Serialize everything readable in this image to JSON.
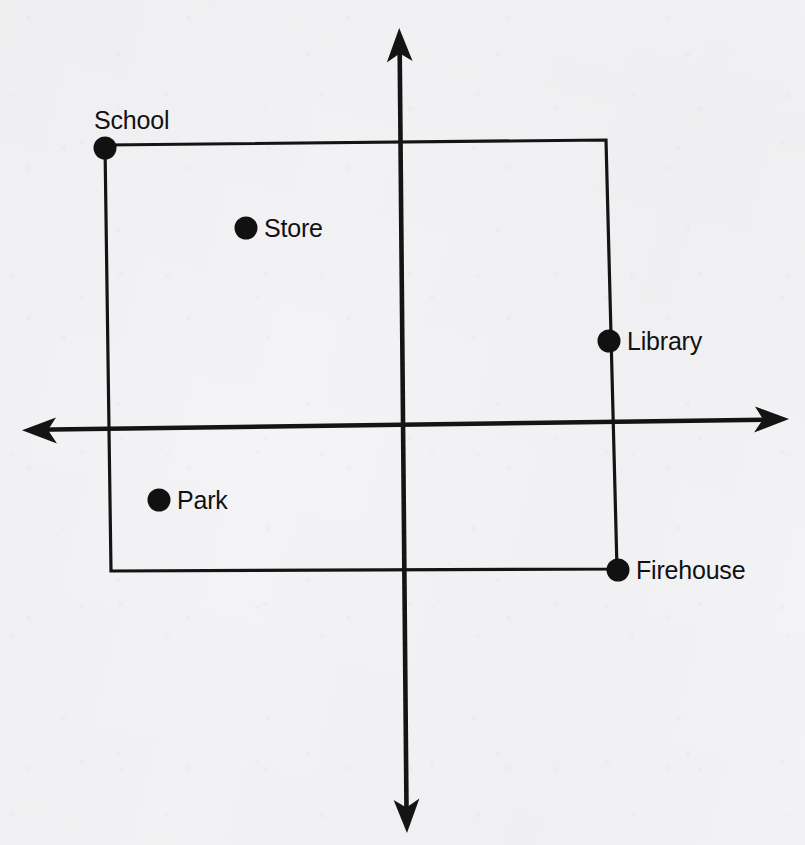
{
  "figure": {
    "background_color": "#f4f4f6",
    "ink_color": "#141414",
    "width": 805,
    "height": 845
  },
  "axes": {
    "origin": {
      "x": 401,
      "y": 427
    },
    "x_axis": {
      "name": "horizontal-axis",
      "left_tip": {
        "x": 22,
        "y": 430
      },
      "right_tip": {
        "x": 789,
        "y": 419
      },
      "arrow_left": true,
      "arrow_right": true
    },
    "y_axis": {
      "name": "vertical-axis",
      "top_tip": {
        "x": 399,
        "y": 28
      },
      "bottom_tip": {
        "x": 407,
        "y": 833
      },
      "arrow_top": true,
      "arrow_bottom": true
    }
  },
  "rectangle": {
    "name": "neighborhood-boundary-rectangle",
    "corners": {
      "top_left": {
        "x": 105,
        "y": 145
      },
      "top_right": {
        "x": 606,
        "y": 140
      },
      "bottom_right": {
        "x": 617,
        "y": 569
      },
      "bottom_left": {
        "x": 111,
        "y": 571
      }
    }
  },
  "points": [
    {
      "id": "school",
      "label": "School",
      "dot": {
        "x": 105,
        "y": 148,
        "r": 11.5
      },
      "label_pos": {
        "x": 94,
        "y": 122
      },
      "label_anchor": "start",
      "on_corner": "top-left"
    },
    {
      "id": "store",
      "label": "Store",
      "dot": {
        "x": 246,
        "y": 228,
        "r": 11.5
      },
      "label_pos": {
        "x": 264,
        "y": 230
      },
      "label_anchor": "start",
      "on_corner": null
    },
    {
      "id": "library",
      "label": "Library",
      "dot": {
        "x": 609,
        "y": 341,
        "r": 11.5
      },
      "label_pos": {
        "x": 627,
        "y": 343
      },
      "label_anchor": "start",
      "on_corner": null
    },
    {
      "id": "park",
      "label": "Park",
      "dot": {
        "x": 159,
        "y": 500,
        "r": 11.5
      },
      "label_pos": {
        "x": 177,
        "y": 502
      },
      "label_anchor": "start",
      "on_corner": null
    },
    {
      "id": "firehouse",
      "label": "Firehouse",
      "dot": {
        "x": 618,
        "y": 570,
        "r": 11.5
      },
      "label_pos": {
        "x": 636,
        "y": 572
      },
      "label_anchor": "start",
      "on_corner": "bottom-right"
    }
  ]
}
